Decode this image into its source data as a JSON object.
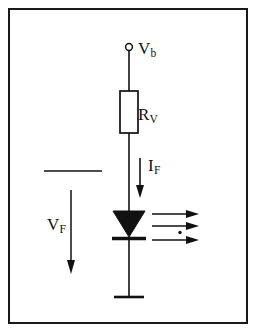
{
  "figure": {
    "background_color": "#ffffff",
    "ink_color": "#111111",
    "border_color": "#1a1a1a",
    "width": 260,
    "height": 336
  },
  "labels": {
    "supply": {
      "symbol": "V",
      "subscript": "b"
    },
    "resistor": {
      "symbol": "R",
      "subscript": "V"
    },
    "current": {
      "symbol": "I",
      "subscript": "F"
    },
    "voltage_drop": {
      "symbol": "V",
      "subscript": "F"
    }
  },
  "components": {
    "supply_terminal": {
      "name": "open-circle-terminal",
      "cx": 129,
      "cy": 47,
      "r": 3.5
    },
    "resistor": {
      "name": "resistor-box",
      "x": 120,
      "y": 91,
      "width": 18,
      "height": 42,
      "fill": "#ffffff"
    },
    "diode": {
      "name": "led-diode",
      "triangle_top_y": 211,
      "triangle_bottom_y": 236,
      "half_width": 16,
      "cathode_bar_y": 238,
      "fill": "#111111"
    },
    "ground": {
      "name": "ground-bar",
      "y": 297,
      "half_width": 15
    },
    "wire": {
      "name": "main-vertical-wire",
      "x": 129,
      "top_y": 51,
      "bottom_y": 297
    }
  },
  "annotations": {
    "current_arrow": {
      "name": "current-direction-arrow",
      "x": 140,
      "from_y": 158,
      "to_y": 196,
      "direction": "down"
    },
    "voltage_arrow": {
      "name": "voltage-drop-arrow",
      "x": 71,
      "from_y": 190,
      "to_y": 272,
      "direction": "down"
    },
    "voltage_reference_line": {
      "name": "voltage-reference-line",
      "x1": 44,
      "x2": 102,
      "y": 171
    },
    "light_rays": {
      "name": "emitted-light-rays",
      "count": 3,
      "direction": "right",
      "rays": [
        {
          "y": 214,
          "x1": 152,
          "x2": 198
        },
        {
          "y": 226,
          "x1": 152,
          "x2": 198
        },
        {
          "y": 239,
          "x1": 152,
          "x2": 198
        }
      ],
      "dot": {
        "cx": 180,
        "cy": 232,
        "r": 1.6
      }
    }
  }
}
